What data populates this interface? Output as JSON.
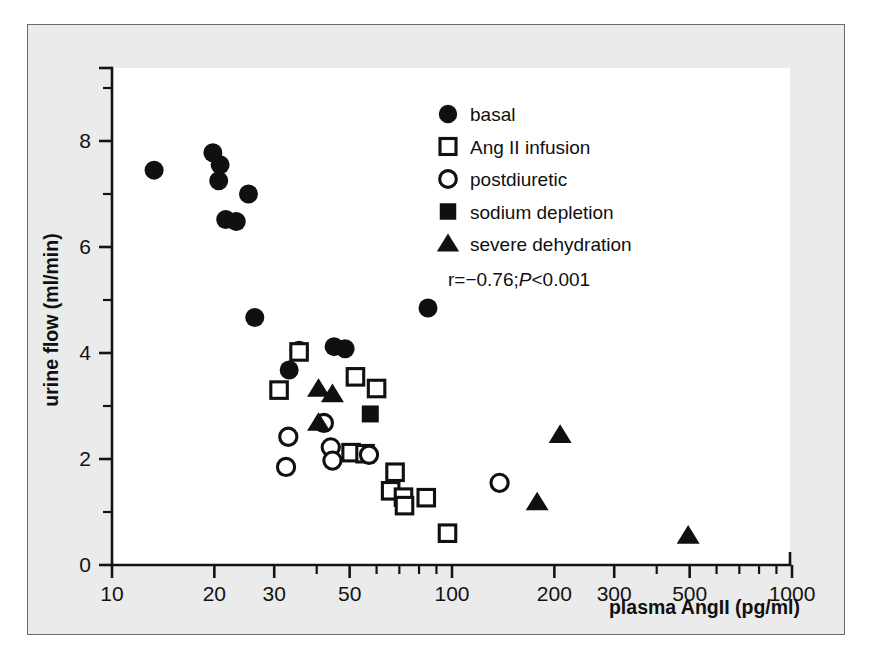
{
  "chart_data": {
    "type": "scatter",
    "title": "",
    "xlabel": "plasma AngII (pg/ml)",
    "ylabel": "urine flow (ml/min)",
    "xscale": "log",
    "yscale": "linear",
    "xlim": [
      10,
      1000
    ],
    "ylim": [
      0,
      9
    ],
    "grid": false,
    "legend_position": "top-right",
    "x_ticks_major": [
      10,
      20,
      30,
      50,
      100,
      200,
      300,
      500,
      1000
    ],
    "x_tick_labels": [
      "10",
      "20",
      "30",
      "50",
      "100",
      "200",
      "300",
      "500",
      "1000"
    ],
    "x_ticks_minor": [
      40,
      60,
      70,
      80,
      90,
      400,
      600,
      700,
      800,
      900
    ],
    "y_ticks_major": [
      0,
      2,
      4,
      6,
      8
    ],
    "y_tick_labels": [
      "0",
      "2",
      "4",
      "6",
      "8"
    ],
    "y_ticks_minor": [
      1,
      3,
      5,
      7,
      9
    ],
    "annotation": "r=−0.76;P<0.001",
    "annotation_parts": {
      "lead": "r=−0.76;",
      "italic": "P",
      "tail": "<0.001"
    },
    "series": [
      {
        "name": "basal",
        "marker": "filled-circle",
        "color": "#101010",
        "points": [
          [
            13.3,
            7.45
          ],
          [
            19.8,
            7.78
          ],
          [
            20.8,
            7.55
          ],
          [
            20.6,
            7.25
          ],
          [
            21.6,
            6.52
          ],
          [
            23.2,
            6.48
          ],
          [
            25.2,
            7.0
          ],
          [
            26.3,
            4.67
          ],
          [
            33.2,
            3.68
          ],
          [
            35.5,
            4.05
          ],
          [
            45.0,
            4.12
          ],
          [
            48.5,
            4.08
          ],
          [
            85.0,
            4.85
          ]
        ]
      },
      {
        "name": "Ang II infusion",
        "marker": "open-square",
        "color": "#101010",
        "points": [
          [
            31.0,
            3.3
          ],
          [
            35.5,
            4.02
          ],
          [
            52.0,
            3.55
          ],
          [
            60.0,
            3.33
          ],
          [
            50.5,
            2.12
          ],
          [
            55.5,
            2.1
          ],
          [
            68.0,
            1.75
          ],
          [
            66.0,
            1.4
          ],
          [
            72.0,
            1.28
          ],
          [
            72.5,
            1.12
          ],
          [
            84.0,
            1.27
          ],
          [
            97.0,
            0.6
          ]
        ]
      },
      {
        "name": "postdiuretic",
        "marker": "open-circle",
        "color": "#101010",
        "points": [
          [
            33.0,
            2.42
          ],
          [
            32.5,
            1.85
          ],
          [
            42.0,
            2.68
          ],
          [
            44.0,
            2.22
          ],
          [
            44.5,
            1.97
          ],
          [
            57.0,
            2.08
          ],
          [
            138.0,
            1.55
          ]
        ]
      },
      {
        "name": "sodium depletion",
        "marker": "filled-square",
        "color": "#101010",
        "points": [
          [
            57.5,
            2.85
          ]
        ]
      },
      {
        "name": "severe dehydration",
        "marker": "filled-triangle",
        "color": "#101010",
        "points": [
          [
            40.5,
            3.32
          ],
          [
            44.5,
            3.22
          ],
          [
            40.5,
            2.68
          ],
          [
            208.0,
            2.45
          ],
          [
            178.0,
            1.18
          ],
          [
            495.0,
            0.55
          ]
        ]
      }
    ]
  },
  "legend": {
    "entries": [
      {
        "label": "basal",
        "marker": "filled-circle"
      },
      {
        "label": "Ang II infusion",
        "marker": "open-square"
      },
      {
        "label": "postdiuretic",
        "marker": "open-circle"
      },
      {
        "label": "sodium depletion",
        "marker": "filled-square"
      },
      {
        "label": "severe dehydration",
        "marker": "filled-triangle"
      }
    ]
  },
  "colors": {
    "page_background": "#ebebeb",
    "frame_border": "#6b6b6b",
    "plot_background": "#ffffff",
    "ink": "#101010"
  }
}
